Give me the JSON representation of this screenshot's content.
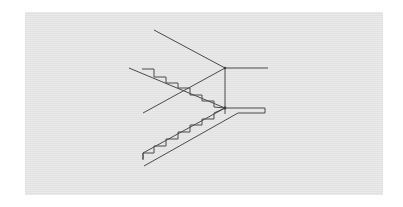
{
  "figure": {
    "colors": {
      "background": "#ffffff",
      "panel": "#e6e6e6",
      "line": "#4a4a4a"
    },
    "elements": {
      "upper_flight_steps": 6,
      "lower_flight_steps": 6,
      "landing": true,
      "construction_lines": 3
    }
  }
}
